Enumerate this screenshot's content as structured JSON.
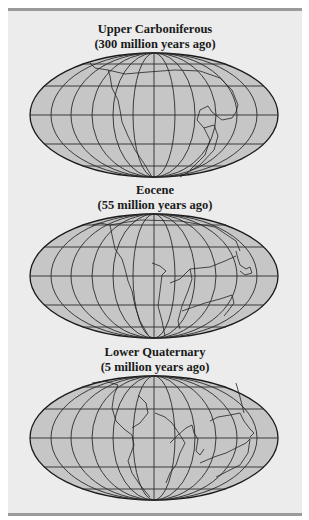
{
  "figure": {
    "panels": [
      {
        "name": "Upper Carboniferous",
        "subtitle": "(300 million years ago)"
      },
      {
        "name": "Eocene",
        "subtitle": "(55 million years ago)"
      },
      {
        "name": "Lower Quaternary",
        "subtitle": "(5 million years ago)"
      }
    ],
    "colors": {
      "background": "#ececec",
      "frame_bar": "#9a9a9a",
      "map_fill": "#c6c6c6",
      "grid_line": "#2a2a2a",
      "title_text": "#1a1a1a"
    }
  }
}
